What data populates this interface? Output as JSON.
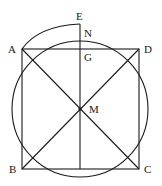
{
  "diagram": {
    "type": "geometry",
    "points": {
      "A": {
        "label": "A",
        "x": 22,
        "y": 49
      },
      "B": {
        "label": "B",
        "x": 22,
        "y": 169
      },
      "C": {
        "label": "C",
        "x": 139,
        "y": 169
      },
      "D": {
        "label": "D",
        "x": 139,
        "y": 49
      },
      "M": {
        "label": "M",
        "x": 80,
        "y": 109
      },
      "E": {
        "label": "E",
        "x": 80,
        "y": 24
      },
      "N": {
        "label": "N",
        "x": 80,
        "y": 41
      },
      "G": {
        "label": "G",
        "x": 80,
        "y": 49
      }
    },
    "labels": {
      "A": "A",
      "B": "B",
      "C": "C",
      "D": "D",
      "E": "E",
      "N": "N",
      "G": "G",
      "M": "M"
    },
    "colors": {
      "stroke": "#1a1a1a",
      "background": "#ffffff"
    }
  }
}
